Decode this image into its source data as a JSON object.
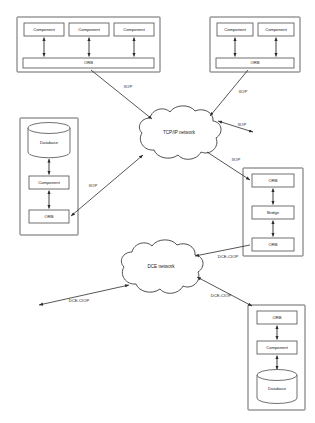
{
  "diagram": {
    "panels": [
      {
        "id": "top-left-orb-domain",
        "components": [
          {
            "label": "Component"
          },
          {
            "label": "Component"
          },
          {
            "label": "Component"
          }
        ],
        "bus": {
          "label": "ORB"
        }
      },
      {
        "id": "top-right-orb-domain",
        "components": [
          {
            "label": "Component"
          },
          {
            "label": "Component"
          }
        ],
        "bus": {
          "label": "ORB"
        }
      },
      {
        "id": "left-database-node",
        "nodes": [
          {
            "label": "Database",
            "shape": "cylinder"
          },
          {
            "label": "Component",
            "shape": "box"
          },
          {
            "label": "ORB",
            "shape": "box"
          }
        ]
      },
      {
        "id": "right-bridge-node",
        "nodes": [
          {
            "label": "ORB",
            "shape": "box"
          },
          {
            "label": "Bridge",
            "shape": "box"
          },
          {
            "label": "ORB",
            "shape": "box"
          }
        ]
      },
      {
        "id": "bottom-right-database-node",
        "nodes": [
          {
            "label": "ORB",
            "shape": "box"
          },
          {
            "label": "Component",
            "shape": "box"
          },
          {
            "label": "Database",
            "shape": "cylinder"
          }
        ]
      }
    ],
    "clouds": [
      {
        "id": "tcpip-cloud",
        "label": "TCP/IP network"
      },
      {
        "id": "dce-cloud",
        "label": "DCE network"
      }
    ],
    "edges": [
      {
        "id": "edge-topleft-to-tcpip",
        "label": "IIOP"
      },
      {
        "id": "edge-topright-to-tcpip",
        "label": "IIOP"
      },
      {
        "id": "edge-tcpip-to-external",
        "label": "IIOP"
      },
      {
        "id": "edge-leftnode-to-tcpip",
        "label": "IIOP"
      },
      {
        "id": "edge-tcpip-to-bridge",
        "label": "IIOP"
      },
      {
        "id": "edge-bridge-to-dce",
        "label": "DCE-CIOP"
      },
      {
        "id": "edge-dce-to-external",
        "label": "DCE-CIOP"
      },
      {
        "id": "edge-dce-to-bottomright",
        "label": "DCE-CIOP"
      }
    ],
    "colors": {
      "background": "#ffffff",
      "stroke": "#2b2b2b",
      "box_stroke": "#4d4d4d",
      "text": "#1a1a1a"
    }
  }
}
